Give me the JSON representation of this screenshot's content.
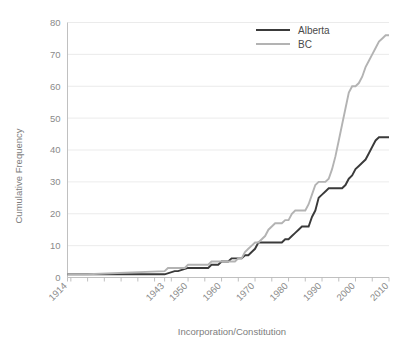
{
  "chart_data": {
    "type": "line",
    "title": "",
    "xlabel": "Incorporation/Constitution",
    "ylabel": "Cumulative Frequency",
    "xlim": [
      1914,
      2010
    ],
    "ylim": [
      0,
      80
    ],
    "grid": true,
    "legend_position": "top-right",
    "y_ticks": [
      0,
      10,
      20,
      30,
      40,
      50,
      60,
      70,
      80
    ],
    "y_tick_labels": [
      "0",
      "10",
      "20",
      "30",
      "40",
      "50",
      "60",
      "70",
      "80"
    ],
    "x_tick_labels": [
      "1914",
      "1943",
      "1950",
      "1960",
      "1970",
      "1980",
      "1990",
      "2000",
      "2010"
    ],
    "x_tick_values": [
      1914,
      1943,
      1950,
      1960,
      1970,
      1980,
      1990,
      2000,
      2010
    ],
    "x_minor_tick_step": 5,
    "series": [
      {
        "name": "Alberta",
        "color": "#3a3a3a",
        "width": 1.9,
        "x": [
          1914,
          1920,
          1943,
          1946,
          1947,
          1950,
          1951,
          1955,
          1956,
          1957,
          1958,
          1959,
          1960,
          1961,
          1962,
          1963,
          1964,
          1965,
          1966,
          1967,
          1968,
          1969,
          1970,
          1971,
          1972,
          1973,
          1974,
          1975,
          1976,
          1977,
          1978,
          1979,
          1980,
          1981,
          1982,
          1983,
          1984,
          1985,
          1986,
          1987,
          1988,
          1989,
          1990,
          1991,
          1992,
          1993,
          1994,
          1995,
          1996,
          1997,
          1998,
          1999,
          2000,
          2001,
          2002,
          2003,
          2004,
          2005,
          2006,
          2007,
          2008,
          2009,
          2010
        ],
        "y": [
          1,
          1,
          1,
          2,
          2,
          3,
          3,
          3,
          3,
          4,
          4,
          4,
          5,
          5,
          5,
          6,
          6,
          6,
          6,
          7,
          7,
          8,
          9,
          11,
          11,
          11,
          11,
          11,
          11,
          11,
          11,
          12,
          12,
          13,
          14,
          15,
          16,
          16,
          16,
          19,
          21,
          25,
          26,
          27,
          28,
          28,
          28,
          28,
          28,
          29,
          31,
          32,
          34,
          35,
          36,
          37,
          39,
          41,
          43,
          44,
          44,
          44,
          44
        ]
      },
      {
        "name": "BC",
        "color": "#b3b3b3",
        "width": 1.9,
        "x": [
          1914,
          1920,
          1943,
          1944,
          1945,
          1946,
          1947,
          1948,
          1949,
          1950,
          1951,
          1955,
          1956,
          1957,
          1958,
          1959,
          1960,
          1961,
          1962,
          1963,
          1964,
          1965,
          1966,
          1967,
          1968,
          1969,
          1970,
          1971,
          1972,
          1973,
          1974,
          1975,
          1976,
          1977,
          1978,
          1979,
          1980,
          1981,
          1982,
          1983,
          1984,
          1985,
          1986,
          1987,
          1988,
          1989,
          1990,
          1991,
          1992,
          1993,
          1994,
          1995,
          1996,
          1997,
          1998,
          1999,
          2000,
          2001,
          2002,
          2003,
          2004,
          2005,
          2006,
          2007,
          2008,
          2009,
          2010
        ],
        "y": [
          1,
          1,
          2,
          3,
          3,
          3,
          3,
          3,
          3,
          4,
          4,
          4,
          4,
          5,
          5,
          5,
          5,
          5,
          5,
          5,
          5,
          6,
          6,
          8,
          9,
          10,
          11,
          11,
          12,
          13,
          15,
          16,
          17,
          17,
          17,
          18,
          18,
          20,
          21,
          21,
          21,
          21,
          23,
          26,
          29,
          30,
          30,
          30,
          31,
          34,
          38,
          43,
          48,
          53,
          58,
          60,
          60,
          61,
          63,
          66,
          68,
          70,
          72,
          74,
          75,
          76,
          76
        ]
      }
    ]
  },
  "legend": {
    "entries": [
      {
        "label": "Alberta",
        "color": "#3a3a3a"
      },
      {
        "label": "BC",
        "color": "#b3b3b3"
      }
    ]
  },
  "axes": {
    "y_title": "Cumulative Frequency",
    "x_title": "Incorporation/Constitution"
  }
}
